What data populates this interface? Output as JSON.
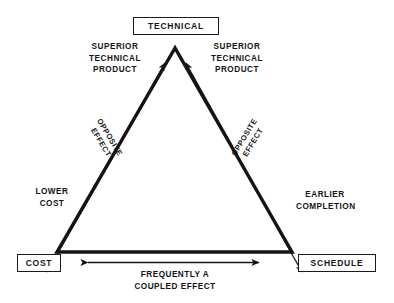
{
  "diagram": {
    "type": "triangle-tradeoff",
    "background_color": "#ffffff",
    "stroke_color": "#151515",
    "vertices": {
      "top": {
        "label": "TECHNICAL"
      },
      "bottom_left": {
        "label": "COST"
      },
      "bottom_right": {
        "label": "SCHEDULE"
      }
    },
    "annotations": {
      "superior_left": "SUPERIOR\nTECHNICAL\nPRODUCT",
      "superior_right": "SUPERIOR\nTECHNICAL\nPRODUCT",
      "opposite_left": "OPPOSITE\nEFFECT",
      "opposite_right": "OPPOSITE\nEFFECT",
      "lower_cost": "LOWER\nCOST",
      "earlier_completion": "EARLIER\nCOMPLETION",
      "coupled_effect": "FREQUENTLY A\nCOUPLED EFFECT"
    },
    "icons": {
      "arrow_up_left": "arrow-up-icon",
      "arrow_up_right": "arrow-up-icon",
      "arrow_down_left": "arrow-down-icon",
      "arrow_down_right": "arrow-down-icon",
      "double_arrow_bottom": "double-arrow-horizontal-icon"
    }
  }
}
